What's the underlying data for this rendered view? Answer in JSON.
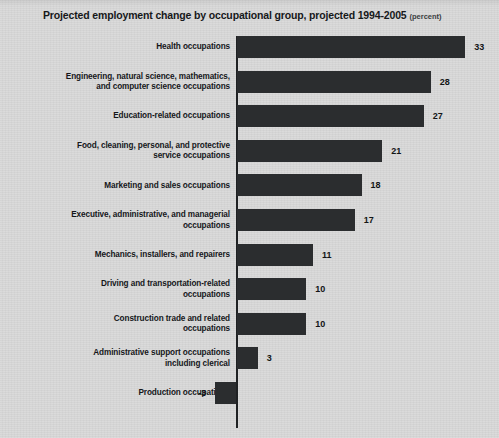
{
  "chart_title": "Projected employment change by occupational group, projected 1994-2005",
  "chart_unit": "(percent)",
  "chart_data": {
    "type": "bar",
    "orientation": "horizontal",
    "title": "Projected employment change by occupational group, projected 1994-2005",
    "unit_note": "(percent)",
    "xlabel": "",
    "ylabel": "",
    "xlim": [
      -5,
      35
    ],
    "grid": false,
    "legend": false,
    "zero_axis": true,
    "categories": [
      "Health occupations",
      "Engineering, natural science, mathematics, and computer science occupations",
      "Education-related occupations",
      "Food, cleaning, personal, and protective service occupations",
      "Marketing and sales occupations",
      "Executive, administrative, and managerial occupations",
      "Mechanics, installers, and repairers",
      "Driving and transportation-related occupations",
      "Construction trade and related occupations",
      "Administrative support occupations including clerical",
      "Production occupations"
    ],
    "values": [
      33,
      28,
      27,
      21,
      18,
      17,
      11,
      10,
      10,
      3,
      -3
    ],
    "colors": {
      "bar": "#2b2d2f",
      "background": "#d8d8d8",
      "axis": "#1f2123",
      "text": "#15171a"
    }
  },
  "rows": [
    {
      "label_line1": "Health occupations",
      "label_line2": "",
      "value": 33,
      "value_text": "33"
    },
    {
      "label_line1": "Engineering, natural science, mathematics,",
      "label_line2": "and computer science occupations",
      "value": 28,
      "value_text": "28"
    },
    {
      "label_line1": "Education-related occupations",
      "label_line2": "",
      "value": 27,
      "value_text": "27"
    },
    {
      "label_line1": "Food, cleaning, personal, and protective",
      "label_line2": "service occupations",
      "value": 21,
      "value_text": "21"
    },
    {
      "label_line1": "Marketing and sales occupations",
      "label_line2": "",
      "value": 18,
      "value_text": "18"
    },
    {
      "label_line1": "Executive, administrative, and managerial",
      "label_line2": "occupations",
      "value": 17,
      "value_text": "17"
    },
    {
      "label_line1": "Mechanics, installers, and repairers",
      "label_line2": "",
      "value": 11,
      "value_text": "11"
    },
    {
      "label_line1": "Driving and transportation-related",
      "label_line2": "occupations",
      "value": 10,
      "value_text": "10"
    },
    {
      "label_line1": "Construction trade and related",
      "label_line2": "occupations",
      "value": 10,
      "value_text": "10"
    },
    {
      "label_line1": "Administrative support occupations",
      "label_line2": "including clerical",
      "value": 3,
      "value_text": "3"
    },
    {
      "label_line1": "Production occupations",
      "label_line2": "",
      "value": -3,
      "value_text": "-3"
    }
  ]
}
